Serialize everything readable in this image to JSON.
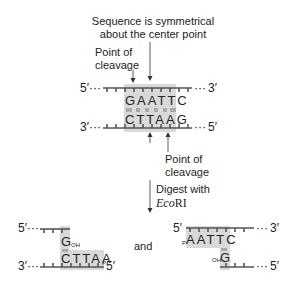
{
  "annotations": {
    "symmetry_line1": "Sequence is symmetrical",
    "symmetry_line2": "about the center point",
    "cleavage_top_line1": "Point of",
    "cleavage_top_line2": "cleavage",
    "cleavage_bottom_line1": "Point of",
    "cleavage_bottom_line2": "cleavage",
    "digest_line1": "Digest with",
    "digest_enzyme_italic": "Eco",
    "digest_enzyme_roman": "RI",
    "and": "and"
  },
  "dna": {
    "top_strand": {
      "left_end": "5′",
      "right_end": "3′",
      "sequence": "GAATTC",
      "dots": "···"
    },
    "bottom_strand": {
      "left_end": "3′",
      "right_end": "5′",
      "sequence": "CTTAAG",
      "dots": "···"
    }
  },
  "fragment_left": {
    "top_left_end": "5′",
    "top_base": "G",
    "top_base_sub": "OH",
    "bottom_seq": "CTTAA",
    "bottom_seq_sub": "P",
    "bottom_left_end": "3′",
    "bottom_right_end": "5′",
    "dots": "···"
  },
  "fragment_right": {
    "top_left_end": "5′",
    "top_right_end": "3′",
    "top_seq_prefix": "P",
    "top_seq": "AATTC",
    "bottom_base_prefix": "OH",
    "bottom_base": "G",
    "bottom_right_end": "5′",
    "dots": "···"
  },
  "colors": {
    "shade": "#d9d9d9",
    "strand": "#555555",
    "text": "#222222"
  }
}
